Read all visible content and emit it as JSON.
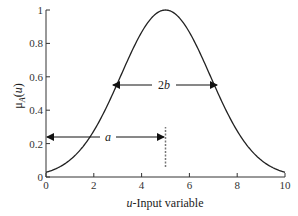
{
  "chart_data": {
    "type": "line",
    "title": "",
    "xlabel": "u-Input variable",
    "xlabel_italic_part": "u",
    "xlabel_rest": "-Input variable",
    "ylabel": "μA(u)",
    "xlim": [
      0,
      10
    ],
    "ylim": [
      0,
      1
    ],
    "xticks": [
      "0",
      "2",
      "4",
      "6",
      "8",
      "10"
    ],
    "yticks": [
      "0",
      "0.2",
      "0.4",
      "0.6",
      "0.8",
      "1"
    ],
    "grid": false,
    "legend": null,
    "series": [
      {
        "name": "Gaussian membership function",
        "function": "exp(-((u-a)^2)/(2*sigma^2))",
        "center": 5,
        "x": [
          0,
          1,
          2,
          3,
          4,
          5,
          6,
          7,
          8,
          9,
          10
        ],
        "values": [
          0.04,
          0.13,
          0.3,
          0.55,
          0.86,
          1.0,
          0.86,
          0.55,
          0.3,
          0.13,
          0.04
        ]
      }
    ],
    "annotations": [
      {
        "type": "double-arrow",
        "label": "a",
        "from_x": 0,
        "to_x": 5,
        "y": 0.24
      },
      {
        "type": "double-arrow",
        "label": "2b",
        "from_x": 2.8,
        "to_x": 7.2,
        "y": 0.5
      },
      {
        "type": "dashed-vline",
        "x": 5,
        "y_from": 0.05,
        "y_to": 0.3
      }
    ]
  }
}
